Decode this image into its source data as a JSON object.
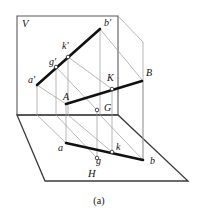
{
  "figure": {
    "caption": "(a)",
    "colors": {
      "ink": "#111111",
      "thin_line": "#8a8a8a",
      "plane_edge": "#555555",
      "background": "#ffffff"
    },
    "planes": [
      {
        "name": "vertical-plane",
        "label": "V",
        "label_x": 22,
        "label_y": 27
      },
      {
        "name": "horizontal-plane",
        "label": "H",
        "label_x": 88,
        "label_y": 177
      }
    ],
    "labels": [
      {
        "id": "b-prime",
        "text": "b′",
        "x": 104,
        "y": 26
      },
      {
        "id": "k-prime",
        "text": "k′",
        "x": 62,
        "y": 49
      },
      {
        "id": "g-prime",
        "text": "g′",
        "x": 49,
        "y": 65
      },
      {
        "id": "a-prime",
        "text": "a′",
        "x": 28,
        "y": 83
      },
      {
        "id": "B",
        "text": "B",
        "x": 146,
        "y": 76
      },
      {
        "id": "K",
        "text": "K",
        "x": 107,
        "y": 81
      },
      {
        "id": "A",
        "text": "A",
        "x": 63,
        "y": 100
      },
      {
        "id": "G",
        "text": "G",
        "x": 104,
        "y": 111
      },
      {
        "id": "a",
        "text": "a",
        "x": 58,
        "y": 151
      },
      {
        "id": "k",
        "text": "k",
        "x": 116,
        "y": 150
      },
      {
        "id": "g",
        "text": "g",
        "x": 96,
        "y": 164
      },
      {
        "id": "b",
        "text": "b",
        "x": 150,
        "y": 164
      }
    ],
    "points": [
      {
        "id": "point-a-prime",
        "x": 37,
        "y": 85
      },
      {
        "id": "point-g-prime",
        "x": 56,
        "y": 67
      },
      {
        "id": "point-k-prime",
        "x": 68,
        "y": 57
      },
      {
        "id": "point-b-prime",
        "x": 100,
        "y": 29
      },
      {
        "id": "point-A",
        "x": 66,
        "y": 104
      },
      {
        "id": "point-K",
        "x": 112,
        "y": 89
      },
      {
        "id": "point-B",
        "x": 142,
        "y": 81
      },
      {
        "id": "point-G",
        "x": 97,
        "y": 110
      },
      {
        "id": "point-a",
        "x": 66,
        "y": 143
      },
      {
        "id": "point-k",
        "x": 112,
        "y": 152
      },
      {
        "id": "point-b",
        "x": 143,
        "y": 160
      },
      {
        "id": "point-g",
        "x": 97,
        "y": 158
      }
    ],
    "segments": [
      {
        "id": "line-a-prime-b-prime",
        "kind": "thick"
      },
      {
        "id": "line-A-B",
        "kind": "thick"
      },
      {
        "id": "line-a-b",
        "kind": "thick"
      }
    ]
  }
}
